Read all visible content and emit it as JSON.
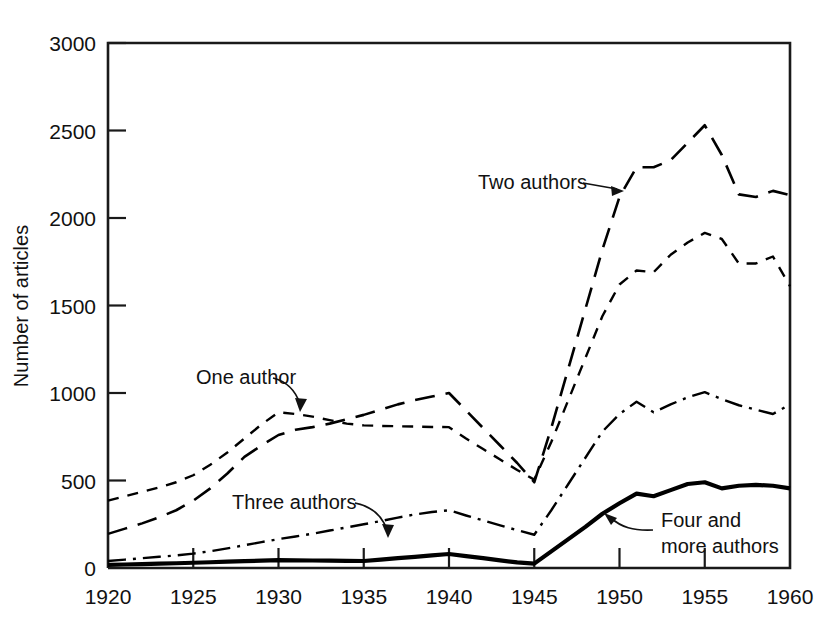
{
  "figure": {
    "background_color": "#ffffff",
    "ink_color": "#000000"
  },
  "axes": {
    "y_title": "Number of articles",
    "y_ticks": [
      "0",
      "500",
      "1000",
      "1500",
      "2000",
      "2500",
      "3000"
    ],
    "x_ticks": [
      "1920",
      "1925",
      "1930",
      "1935",
      "1940",
      "1945",
      "1950",
      "1955",
      "1960"
    ]
  },
  "annotations": {
    "one_author": "One author",
    "two_authors": "Two authors",
    "three_authors": "Three authors",
    "four_more_authors_line1": "Four and",
    "four_more_authors_line2": "more authors"
  },
  "chart_data": {
    "type": "line",
    "title": "",
    "xlabel": "",
    "ylabel": "Number of articles",
    "xlim": [
      1920,
      1960
    ],
    "ylim": [
      0,
      3000
    ],
    "ytick_step": 500,
    "xtick_step": 5,
    "grid": false,
    "legend_position": "inline-annotations",
    "series": [
      {
        "name": "One author",
        "line_style": "short-dash",
        "stroke_width": 2.4,
        "dash_pattern": "11,9",
        "x": [
          1920,
          1921,
          1922,
          1923,
          1924,
          1925,
          1926,
          1927,
          1928,
          1929,
          1930,
          1931,
          1932,
          1933,
          1934,
          1935,
          1936,
          1937,
          1938,
          1939,
          1940,
          1941,
          1942,
          1943,
          1944,
          1945,
          1946,
          1947,
          1948,
          1949,
          1950,
          1951,
          1952,
          1953,
          1954,
          1955,
          1956,
          1957,
          1958,
          1959,
          1960
        ],
        "values": [
          385,
          410,
          435,
          460,
          490,
          530,
          590,
          660,
          740,
          820,
          890,
          880,
          865,
          845,
          825,
          815,
          812,
          810,
          808,
          806,
          805,
          740,
          680,
          620,
          560,
          505,
          720,
          960,
          1200,
          1440,
          1620,
          1700,
          1690,
          1790,
          1860,
          1915,
          1880,
          1740,
          1740,
          1780,
          1610
        ]
      },
      {
        "name": "Two authors",
        "line_style": "long-dash",
        "stroke_width": 2.6,
        "dash_pattern": "20,11",
        "x": [
          1920,
          1921,
          1922,
          1923,
          1924,
          1925,
          1926,
          1927,
          1928,
          1929,
          1930,
          1931,
          1932,
          1933,
          1934,
          1935,
          1936,
          1937,
          1938,
          1939,
          1940,
          1941,
          1942,
          1943,
          1944,
          1945,
          1946,
          1947,
          1948,
          1949,
          1950,
          1951,
          1952,
          1953,
          1954,
          1955,
          1956,
          1957,
          1958,
          1959,
          1960
        ],
        "values": [
          195,
          225,
          255,
          290,
          330,
          385,
          455,
          540,
          635,
          700,
          760,
          790,
          805,
          825,
          850,
          875,
          905,
          935,
          960,
          980,
          1000,
          900,
          800,
          700,
          600,
          490,
          800,
          1140,
          1480,
          1820,
          2120,
          2290,
          2290,
          2330,
          2430,
          2530,
          2360,
          2135,
          2120,
          2155,
          2130
        ]
      },
      {
        "name": "Three authors",
        "line_style": "dash-dot",
        "stroke_width": 2.4,
        "dash_pattern": "18,7,3,7",
        "x": [
          1920,
          1921,
          1922,
          1923,
          1924,
          1925,
          1926,
          1927,
          1928,
          1929,
          1930,
          1931,
          1932,
          1933,
          1934,
          1935,
          1936,
          1937,
          1938,
          1939,
          1940,
          1941,
          1942,
          1943,
          1944,
          1945,
          1946,
          1947,
          1948,
          1949,
          1950,
          1951,
          1952,
          1953,
          1954,
          1955,
          1956,
          1957,
          1958,
          1959,
          1960
        ],
        "values": [
          40,
          48,
          56,
          64,
          72,
          82,
          96,
          112,
          130,
          148,
          165,
          180,
          196,
          214,
          232,
          250,
          268,
          288,
          306,
          320,
          330,
          300,
          272,
          244,
          216,
          190,
          330,
          480,
          630,
          780,
          880,
          950,
          890,
          935,
          975,
          1005,
          965,
          930,
          905,
          880,
          935
        ]
      },
      {
        "name": "Four and more authors",
        "line_style": "solid",
        "stroke_width": 4.2,
        "dash_pattern": "none",
        "x": [
          1920,
          1921,
          1922,
          1923,
          1924,
          1925,
          1926,
          1927,
          1928,
          1929,
          1930,
          1931,
          1932,
          1933,
          1934,
          1935,
          1936,
          1937,
          1938,
          1939,
          1940,
          1941,
          1942,
          1943,
          1944,
          1945,
          1946,
          1947,
          1948,
          1949,
          1950,
          1951,
          1952,
          1953,
          1954,
          1955,
          1956,
          1957,
          1958,
          1959,
          1960
        ],
        "values": [
          18,
          20,
          22,
          25,
          27,
          30,
          33,
          36,
          39,
          42,
          45,
          44,
          43,
          42,
          41,
          40,
          48,
          56,
          64,
          72,
          80,
          68,
          56,
          44,
          32,
          25,
          95,
          165,
          235,
          310,
          370,
          425,
          410,
          445,
          480,
          490,
          455,
          470,
          475,
          470,
          455
        ]
      }
    ]
  }
}
